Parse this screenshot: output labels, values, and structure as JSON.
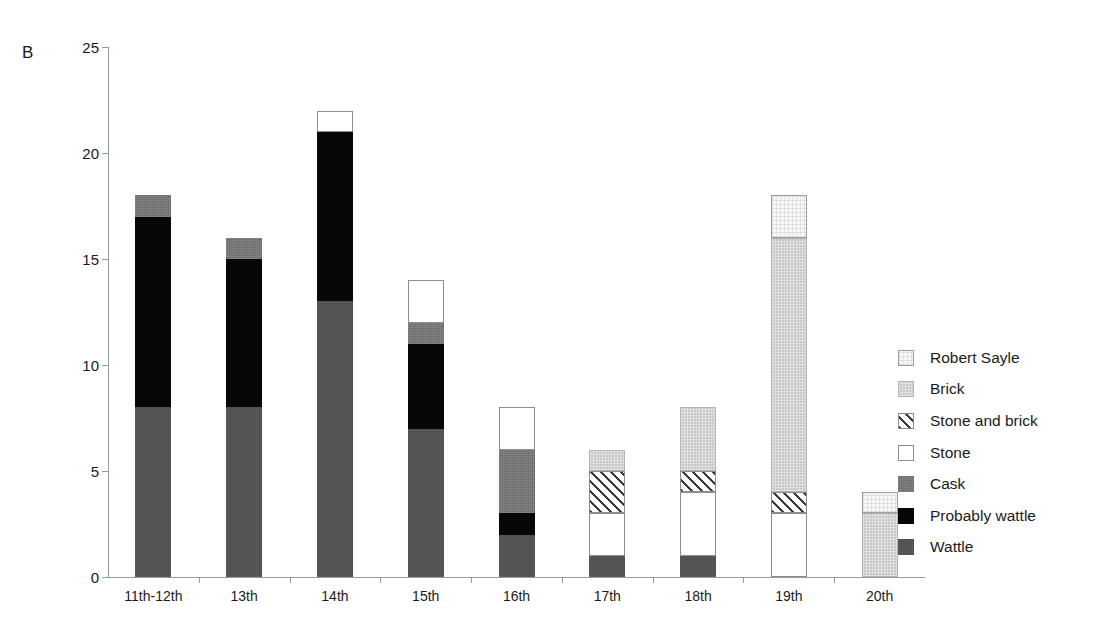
{
  "panel_label": "B",
  "chart_data": {
    "type": "bar",
    "subtype": "stacked-bar",
    "title": "",
    "xlabel": "",
    "ylabel": "",
    "ylim": [
      0,
      25
    ],
    "yticks": [
      0,
      5,
      10,
      15,
      20,
      25
    ],
    "ytick_labels": [
      "0",
      "5",
      "10",
      "15",
      "20",
      "25"
    ],
    "grid": false,
    "legend_position": "right",
    "categories": [
      "11th-12th",
      "13th",
      "14th",
      "15th",
      "16th",
      "17th",
      "18th",
      "19th",
      "20th"
    ],
    "series": [
      {
        "name": "Wattle",
        "color": "#4b4b4b",
        "pattern": "solid-dark-gray",
        "values": [
          8,
          8,
          13,
          7,
          2,
          1,
          1,
          0,
          0
        ]
      },
      {
        "name": "Probably wattle",
        "color": "#070707",
        "pattern": "solid-black",
        "values": [
          9,
          7,
          8,
          4,
          1,
          0,
          0,
          0,
          0
        ]
      },
      {
        "name": "Cask",
        "color": "#6b6b6b",
        "pattern": "solid-mid-gray",
        "values": [
          1,
          1,
          0,
          1,
          3,
          0,
          0,
          0,
          0
        ]
      },
      {
        "name": "Stone",
        "color": "#ffffff",
        "pattern": "open-white",
        "values": [
          0,
          0,
          1,
          2,
          2,
          2,
          3,
          3,
          0
        ]
      },
      {
        "name": "Stone and brick",
        "color": "#ffffff",
        "pattern": "diagonal-hatch",
        "values": [
          0,
          0,
          0,
          0,
          0,
          2,
          1,
          1,
          0
        ]
      },
      {
        "name": "Brick",
        "color": "#c9c9c9",
        "pattern": "light-gray",
        "values": [
          0,
          0,
          0,
          0,
          0,
          1,
          3,
          12,
          3
        ]
      },
      {
        "name": "Robert Sayle",
        "color": "#f7f7f7",
        "pattern": "very-light",
        "values": [
          0,
          0,
          0,
          0,
          0,
          0,
          0,
          2,
          1
        ]
      }
    ],
    "totals": [
      18,
      16,
      22,
      14,
      8,
      6,
      8,
      18,
      4
    ],
    "stack_order_bottom_to_top": [
      "Wattle",
      "Probably wattle",
      "Cask",
      "Stone",
      "Stone and brick",
      "Brick",
      "Robert Sayle"
    ]
  },
  "legend": {
    "entries": [
      {
        "label": "Robert Sayle",
        "swatch": "very-light",
        "series": "Robert Sayle"
      },
      {
        "label": "Brick",
        "swatch": "light-gray",
        "series": "Brick"
      },
      {
        "label": "Stone and brick",
        "swatch": "diagonal-hatch",
        "series": "Stone and brick"
      },
      {
        "label": "Stone",
        "swatch": "open-white",
        "series": "Stone"
      },
      {
        "label": "Cask",
        "swatch": "solid-mid-gray",
        "series": "Cask"
      },
      {
        "label": "Probably wattle",
        "swatch": "solid-black",
        "series": "Probably wattle"
      },
      {
        "label": "Wattle",
        "swatch": "solid-dark-gray",
        "series": "Wattle"
      }
    ]
  },
  "colors": {
    "axis": "#9a9a9a",
    "text": "#1a1a1a",
    "background": "#ffffff"
  }
}
